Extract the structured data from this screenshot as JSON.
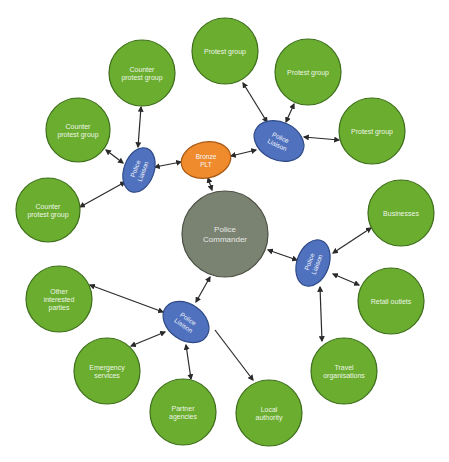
{
  "diagram": {
    "colors": {
      "group": "#6aad2f",
      "commander": "#7a8272",
      "liaison": "#4f71be",
      "bronze": "#ef8b2c",
      "edge": "#2a2a2a"
    },
    "nodes": [
      {
        "id": "commander",
        "type": "commander",
        "lines": [
          "Police",
          "Commander"
        ],
        "cx": 225,
        "cy": 234,
        "r": 43
      },
      {
        "id": "bronze",
        "type": "bronze",
        "lines": [
          "Bronze",
          "PLT"
        ],
        "cx": 206,
        "cy": 160,
        "rx": 25,
        "ry": 18,
        "rot": -12
      },
      {
        "id": "liaison_left",
        "type": "liaison",
        "lines": [
          "Police",
          "Liaison"
        ],
        "cx": 139,
        "cy": 170,
        "rx": 15,
        "ry": 23,
        "rot": 20,
        "textRot": -70
      },
      {
        "id": "liaison_top",
        "type": "liaison",
        "lines": [
          "Police",
          "Liaison"
        ],
        "cx": 279,
        "cy": 141,
        "rx": 26,
        "ry": 19,
        "rot": 25,
        "textRot": 25
      },
      {
        "id": "liaison_right",
        "type": "liaison",
        "lines": [
          "Police",
          "Liaison"
        ],
        "cx": 313,
        "cy": 263,
        "rx": 16,
        "ry": 24,
        "rot": 20,
        "textRot": -70
      },
      {
        "id": "liaison_bottom",
        "type": "liaison",
        "lines": [
          "Police",
          "Liaison"
        ],
        "cx": 186,
        "cy": 322,
        "rx": 25,
        "ry": 18,
        "rot": 35,
        "textRot": 35
      },
      {
        "id": "counter_top",
        "type": "group",
        "lines": [
          "Counter",
          "protest group"
        ],
        "cx": 142,
        "cy": 73,
        "r": 33
      },
      {
        "id": "counter_left",
        "type": "group",
        "lines": [
          "Counter",
          "protest group"
        ],
        "cx": 78,
        "cy": 130,
        "r": 32
      },
      {
        "id": "counter_bottom",
        "type": "group",
        "lines": [
          "Counter",
          "protest group"
        ],
        "cx": 48,
        "cy": 210,
        "r": 32
      },
      {
        "id": "protest_1",
        "type": "group",
        "lines": [
          "Protest  group"
        ],
        "cx": 225,
        "cy": 51,
        "r": 33
      },
      {
        "id": "protest_2",
        "type": "group",
        "lines": [
          "Protest  group"
        ],
        "cx": 308,
        "cy": 72,
        "r": 33
      },
      {
        "id": "protest_3",
        "type": "group",
        "lines": [
          "Protest group"
        ],
        "cx": 372,
        "cy": 131,
        "r": 33
      },
      {
        "id": "businesses",
        "type": "group",
        "lines": [
          "Businesses"
        ],
        "cx": 401,
        "cy": 213,
        "r": 33
      },
      {
        "id": "retail",
        "type": "group",
        "lines": [
          "Retail outlets"
        ],
        "cx": 391,
        "cy": 301,
        "r": 33
      },
      {
        "id": "travel",
        "type": "group",
        "lines": [
          "Travel",
          "organisations"
        ],
        "cx": 344,
        "cy": 371,
        "r": 33
      },
      {
        "id": "local_authority",
        "type": "group",
        "lines": [
          "Local",
          "authority"
        ],
        "cx": 269,
        "cy": 413,
        "r": 33
      },
      {
        "id": "partner",
        "type": "group",
        "lines": [
          "Partner",
          "agencies"
        ],
        "cx": 183,
        "cy": 412,
        "r": 33
      },
      {
        "id": "emergency",
        "type": "group",
        "lines": [
          "Emergency",
          "services"
        ],
        "cx": 107,
        "cy": 371,
        "r": 33
      },
      {
        "id": "other",
        "type": "group",
        "lines": [
          "Other",
          "interested",
          "parties"
        ],
        "cx": 59,
        "cy": 299,
        "r": 33
      }
    ],
    "edges": [
      {
        "from": "commander",
        "to": "bronze",
        "x1": 212,
        "y1": 190,
        "x2": 208,
        "y2": 178
      },
      {
        "from": "bronze",
        "to": "liaison_left",
        "x1": 181,
        "y1": 162,
        "x2": 155,
        "y2": 167
      },
      {
        "from": "bronze",
        "to": "liaison_top",
        "x1": 231,
        "y1": 156,
        "x2": 256,
        "y2": 150
      },
      {
        "from": "liaison_left",
        "to": "counter_top",
        "x1": 138,
        "y1": 147,
        "x2": 141,
        "y2": 107
      },
      {
        "from": "liaison_left",
        "to": "counter_left",
        "x1": 123,
        "y1": 163,
        "x2": 106,
        "y2": 150
      },
      {
        "from": "liaison_left",
        "to": "counter_bottom",
        "x1": 125,
        "y1": 182,
        "x2": 80,
        "y2": 207
      },
      {
        "from": "liaison_top",
        "to": "protest_1",
        "x1": 267,
        "y1": 122,
        "x2": 243,
        "y2": 83
      },
      {
        "from": "liaison_top",
        "to": "protest_2",
        "x1": 286,
        "y1": 122,
        "x2": 294,
        "y2": 104
      },
      {
        "from": "liaison_top",
        "to": "protest_3",
        "x1": 304,
        "y1": 137,
        "x2": 339,
        "y2": 140
      },
      {
        "from": "commander",
        "to": "liaison_right",
        "x1": 268,
        "y1": 250,
        "x2": 297,
        "y2": 260
      },
      {
        "from": "liaison_right",
        "to": "businesses",
        "x1": 333,
        "y1": 253,
        "x2": 371,
        "y2": 228
      },
      {
        "from": "liaison_right",
        "to": "retail",
        "x1": 333,
        "y1": 274,
        "x2": 359,
        "y2": 285
      },
      {
        "from": "liaison_right",
        "to": "travel",
        "x1": 320,
        "y1": 287,
        "x2": 322,
        "y2": 341
      },
      {
        "from": "commander",
        "to": "liaison_bottom",
        "x1": 210,
        "y1": 277,
        "x2": 196,
        "y2": 302
      },
      {
        "from": "liaison_bottom",
        "to": "other",
        "x1": 163,
        "y1": 312,
        "x2": 90,
        "y2": 285
      },
      {
        "from": "liaison_bottom",
        "to": "emergency",
        "x1": 165,
        "y1": 332,
        "x2": 131,
        "y2": 346
      },
      {
        "from": "liaison_bottom",
        "to": "partner",
        "x1": 186,
        "y1": 345,
        "x2": 191,
        "y2": 379
      },
      {
        "from": "liaison_bottom",
        "to": "local_authority",
        "x1": 215,
        "y1": 330,
        "x2": 253,
        "y2": 380,
        "oneWay": true
      }
    ]
  }
}
